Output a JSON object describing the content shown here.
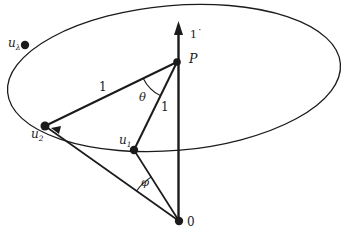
{
  "figure": {
    "background": "#ffffff",
    "ink": "#1b1b1b",
    "width": 346,
    "height": 237,
    "ellipse": {
      "name": "circle-in-perspective",
      "cx": 174,
      "cy": 78,
      "rx": 167,
      "ry": 72.5,
      "rotate": -5,
      "w": 1.3
    },
    "axis": {
      "name": "vertical-axis",
      "x": 178.5,
      "y_bottom": 221,
      "y_shaft_top": 33,
      "w": 2.4,
      "arrowhead": [
        [
          178.5,
          21
        ],
        [
          174,
          35
        ],
        [
          183,
          35
        ]
      ],
      "label": {
        "text": "1˙",
        "x": 190,
        "y": 38,
        "italic": false,
        "size": 11
      }
    },
    "points": [
      {
        "name": "point-u-lambda",
        "x": 25,
        "y": 45,
        "r": 4.2,
        "label": {
          "main": "u",
          "sub": "λ",
          "x": 8,
          "y": 47,
          "italic": true,
          "size": 12
        }
      },
      {
        "name": "point-u2",
        "x": 45,
        "y": 126,
        "r": 4.5,
        "label": {
          "main": "u",
          "sub": "2",
          "x": 31,
          "y": 138,
          "italic": true,
          "size": 12
        }
      },
      {
        "name": "point-u1",
        "x": 134,
        "y": 150,
        "r": 4.2,
        "label": {
          "main": "u",
          "sub": "1",
          "x": 119,
          "y": 144,
          "italic": true,
          "size": 12
        }
      },
      {
        "name": "point-P",
        "x": 177,
        "y": 62,
        "r": 3.8,
        "label": {
          "main": "P",
          "sub": "",
          "x": 189,
          "y": 63,
          "italic": true,
          "size": 12.5
        }
      },
      {
        "name": "point-origin",
        "x": 179,
        "y": 221,
        "r": 4.2,
        "label": {
          "main": "0",
          "sub": "",
          "x": 187,
          "y": 226,
          "italic": false,
          "size": 12
        }
      }
    ],
    "segments": [
      {
        "name": "segment-u2-P",
        "x1": 45,
        "y1": 126,
        "x2": 177,
        "y2": 62,
        "w": 2.0,
        "label": {
          "text": "1",
          "x": 99,
          "y": 91,
          "italic": false,
          "size": 12
        }
      },
      {
        "name": "segment-P-u1",
        "x1": 177,
        "y1": 62,
        "x2": 134,
        "y2": 150,
        "w": 2.0,
        "label": {
          "text": "1",
          "x": 161,
          "y": 111,
          "italic": false,
          "size": 12
        }
      },
      {
        "name": "segment-u1-origin",
        "x1": 134,
        "y1": 150,
        "x2": 179,
        "y2": 221,
        "w": 1.7,
        "label": null
      },
      {
        "name": "segment-u2-origin",
        "x1": 45,
        "y1": 126,
        "x2": 179,
        "y2": 221,
        "w": 1.7,
        "label": null
      }
    ],
    "angle_arcs": [
      {
        "name": "angle-theta-arc",
        "cx": 177,
        "cy": 62,
        "r": 37.5,
        "a1": 154,
        "a2": 116.3,
        "sweep": 0,
        "w": 1.1,
        "label": {
          "text": "θ",
          "x": 139,
          "y": 101,
          "italic": true,
          "size": 11.5
        }
      },
      {
        "name": "angle-phi-arc",
        "cx": 179,
        "cy": 221,
        "r": 52,
        "a1": 215.3,
        "a2": 238,
        "sweep": 1,
        "w": 1.1,
        "label": {
          "text": "φ",
          "x": 141,
          "y": 186,
          "italic": true,
          "size": 11.5
        }
      }
    ],
    "direction_arrowhead": {
      "name": "rotation-direction-arrowhead",
      "points": [
        [
          51,
          128
        ],
        [
          61,
          126
        ],
        [
          59,
          134
        ]
      ]
    }
  }
}
